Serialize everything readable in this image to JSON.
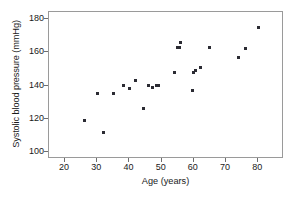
{
  "chart_data": {
    "type": "scatter",
    "title": "",
    "xlabel": "Age (years)",
    "ylabel": "Systolic blood pressure (mmHg)",
    "xlim": [
      15,
      88
    ],
    "ylim": [
      96,
      184
    ],
    "xticks": [
      20,
      30,
      40,
      50,
      60,
      70,
      80
    ],
    "yticks": [
      100,
      120,
      140,
      160,
      180
    ],
    "grid": false,
    "legend": null,
    "marker": "square",
    "marker_color": "#2b2b33",
    "frame_color": "#9a9a9a",
    "x": [
      26,
      30,
      32,
      35,
      38,
      40,
      42,
      44.5,
      46,
      47,
      48.5,
      49,
      54,
      55,
      55.5,
      56,
      59.5,
      60,
      60.5,
      62,
      65,
      74,
      76,
      80
    ],
    "y": [
      119,
      135,
      112,
      135,
      140,
      138,
      143,
      126,
      140,
      139,
      140,
      140,
      148,
      163,
      162.5,
      166,
      137,
      148,
      149,
      151,
      163,
      157,
      162,
      175
    ],
    "points": [
      {
        "age": 26,
        "sbp": 119
      },
      {
        "age": 30,
        "sbp": 135
      },
      {
        "age": 32,
        "sbp": 112
      },
      {
        "age": 35,
        "sbp": 135
      },
      {
        "age": 38,
        "sbp": 140
      },
      {
        "age": 40,
        "sbp": 138
      },
      {
        "age": 42,
        "sbp": 143
      },
      {
        "age": 44.5,
        "sbp": 126
      },
      {
        "age": 46,
        "sbp": 140
      },
      {
        "age": 47,
        "sbp": 139
      },
      {
        "age": 48.5,
        "sbp": 140
      },
      {
        "age": 49,
        "sbp": 140
      },
      {
        "age": 54,
        "sbp": 148
      },
      {
        "age": 55,
        "sbp": 163
      },
      {
        "age": 55.5,
        "sbp": 162.5
      },
      {
        "age": 56,
        "sbp": 166
      },
      {
        "age": 59.5,
        "sbp": 137
      },
      {
        "age": 60,
        "sbp": 148
      },
      {
        "age": 60.5,
        "sbp": 149
      },
      {
        "age": 62,
        "sbp": 151
      },
      {
        "age": 65,
        "sbp": 163
      },
      {
        "age": 74,
        "sbp": 157
      },
      {
        "age": 76,
        "sbp": 162
      },
      {
        "age": 80,
        "sbp": 175
      }
    ]
  }
}
